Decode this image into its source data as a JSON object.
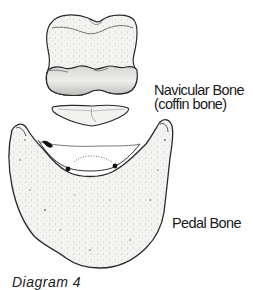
{
  "diagram": {
    "caption": "Diagram 4",
    "labels": {
      "navicular_line1": "Navicular Bone",
      "navicular_line2": "(coffin bone)",
      "pedal": "Pedal Bone"
    },
    "parts": [
      "short-pastern-bone",
      "navicular-bone",
      "pedal-bone"
    ],
    "colors": {
      "outline": "#2a2a2a",
      "fill": "#f4f4f2",
      "shade": "#c8c8c6",
      "text": "#1a1a1a"
    }
  }
}
